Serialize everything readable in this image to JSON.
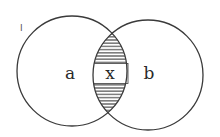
{
  "diagram": {
    "type": "venn",
    "sets": [
      {
        "label": "a",
        "cx": 72,
        "cy": 71,
        "r": 55
      },
      {
        "label": "b",
        "cx": 148,
        "cy": 75,
        "r": 55
      }
    ],
    "intersection": {
      "label": "x",
      "shading": "horizontal-hatch"
    },
    "corner_mark": "I",
    "colors": {
      "stroke": "#3a3a3a",
      "background": "#ffffff",
      "text": "#2a2a2a"
    }
  }
}
